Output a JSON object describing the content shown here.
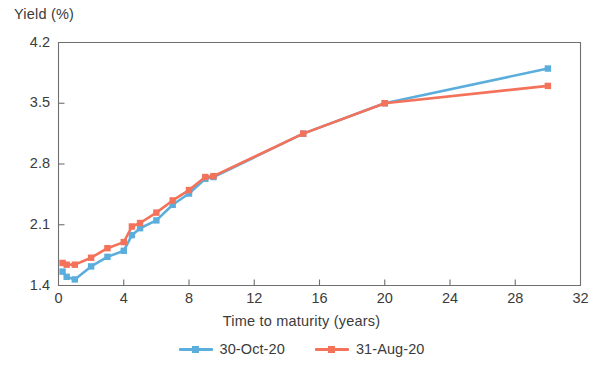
{
  "chart_data": {
    "type": "line",
    "title": "",
    "xlabel": "Time to maturity (years)",
    "ylabel": "Yield (%)",
    "xlim": [
      0,
      32
    ],
    "ylim": [
      1.4,
      4.2
    ],
    "xticks": [
      "0",
      "4",
      "8",
      "12",
      "16",
      "20",
      "24",
      "28",
      "32"
    ],
    "yticks": [
      "1.4",
      "2.1",
      "2.8",
      "3.5",
      "4.2"
    ],
    "grid": false,
    "legend_position": "bottom-center",
    "markers": "square",
    "series": [
      {
        "name": "30-Oct-20",
        "color": "#5BAEDC",
        "x": [
          0.25,
          0.5,
          1,
          2,
          3,
          4,
          4.5,
          5,
          6,
          7,
          8,
          9,
          9.5,
          15,
          20,
          30
        ],
        "values": [
          1.56,
          1.5,
          1.47,
          1.62,
          1.73,
          1.8,
          1.98,
          2.06,
          2.15,
          2.33,
          2.46,
          2.63,
          2.65,
          3.15,
          3.5,
          3.9
        ]
      },
      {
        "name": "31-Aug-20",
        "color": "#F4715A",
        "x": [
          0.25,
          0.5,
          1,
          2,
          3,
          4,
          4.5,
          5,
          6,
          7,
          8,
          9,
          9.5,
          15,
          20,
          30
        ],
        "values": [
          1.66,
          1.64,
          1.64,
          1.72,
          1.83,
          1.9,
          2.08,
          2.12,
          2.24,
          2.38,
          2.5,
          2.65,
          2.66,
          3.15,
          3.5,
          3.7
        ]
      }
    ]
  },
  "axis": {
    "y_label": "Yield (%)",
    "x_label": "Time to maturity (years)"
  },
  "legend": {
    "items": [
      {
        "label": "30-Oct-20",
        "color": "#5BAEDC"
      },
      {
        "label": "31-Aug-20",
        "color": "#F4715A"
      }
    ]
  }
}
